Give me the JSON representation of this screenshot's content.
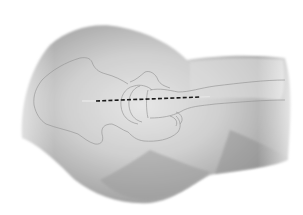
{
  "figure": {
    "subject": "Hip region lateral view with incision line",
    "colors": {
      "background": "#ffffff",
      "skin_light": "#dcdcdc",
      "skin_mid": "#bdbdbd",
      "skin_dark": "#8f8f8f",
      "bone_outline": "#9a9a9a",
      "incision": "#1a1a1a"
    },
    "elements": [
      {
        "name": "body-silhouette"
      },
      {
        "name": "pelvis-outline"
      },
      {
        "name": "femoral-head-outline"
      },
      {
        "name": "greater-trochanter-outline"
      },
      {
        "name": "femur-shaft-outline"
      },
      {
        "name": "incision-line",
        "style": "dashed"
      }
    ]
  }
}
